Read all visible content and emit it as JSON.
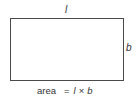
{
  "diagram": {
    "shape": "rectangle",
    "labels": {
      "length": "l",
      "breadth": "b"
    },
    "formula": {
      "lhs": "area",
      "equals": "=",
      "term1": "l",
      "operator": "×",
      "term2": "b"
    },
    "colors": {
      "outline": "#4a4a4a",
      "text": "#333333",
      "background": "#ffffff"
    }
  }
}
